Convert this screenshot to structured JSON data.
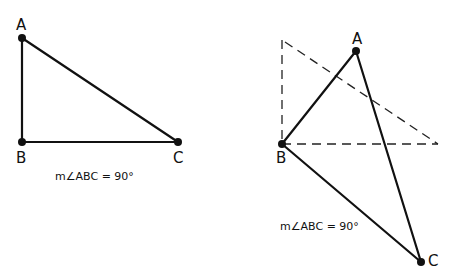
{
  "figures": [
    {
      "name": "original-triangle",
      "points": {
        "A": {
          "label": "A",
          "x": 22,
          "y": 38
        },
        "B": {
          "label": "B",
          "x": 22,
          "y": 142
        },
        "C": {
          "label": "C",
          "x": 178,
          "y": 142
        }
      },
      "measure_label": "m∠ABC = 90°"
    },
    {
      "name": "rotated-triangle",
      "points": {
        "A": {
          "label": "A",
          "x": 356,
          "y": 51
        },
        "B": {
          "label": "B",
          "x": 282,
          "y": 144
        },
        "C": {
          "label": "C",
          "x": 421,
          "y": 262
        }
      },
      "ghost": {
        "top": [
          282,
          40
        ],
        "corner": [
          282,
          144
        ],
        "right": [
          438,
          144
        ]
      },
      "measure_label": "m∠ABC = 90°"
    }
  ]
}
